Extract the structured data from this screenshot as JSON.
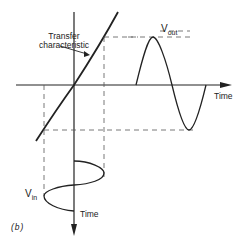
{
  "figure": {
    "label": "(b)",
    "transfer_label_line1": "Transfer",
    "transfer_label_line2": "characteristic",
    "vout_label": "V",
    "vout_sub": "out",
    "vin_label": "V",
    "vin_sub": "in",
    "time_right": "Time",
    "time_bottom": "Time"
  }
}
